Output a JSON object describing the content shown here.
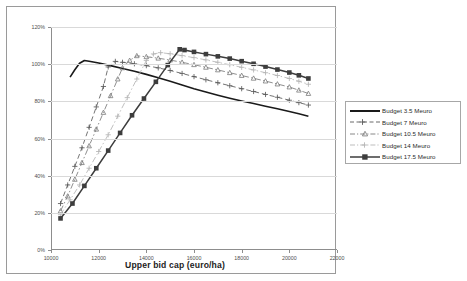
{
  "chart_data": {
    "type": "line",
    "title": "",
    "xlabel": "Upper bid cap (euro/ha)",
    "ylabel": "",
    "xlim": [
      10000,
      22000
    ],
    "ylim": [
      0,
      120
    ],
    "xticks": [
      "10000",
      "12000",
      "14000",
      "16000",
      "18000",
      "20000",
      "22000"
    ],
    "xtick_values": [
      10000,
      12000,
      14000,
      16000,
      18000,
      20000,
      22000
    ],
    "yticks": [
      "0%",
      "20%",
      "40%",
      "60%",
      "80%",
      "100%",
      "120%"
    ],
    "ytick_values": [
      0,
      20,
      40,
      60,
      80,
      100,
      120
    ],
    "grid": true,
    "legend_position": "right",
    "series": [
      {
        "name": "Budget 3.5 Meuro",
        "color": "#1a1a1a",
        "style": "solid",
        "marker": "none",
        "x": [
          10800,
          11000,
          11200,
          11400,
          11600,
          12000,
          12500,
          13000,
          13500,
          14000,
          14500,
          15000,
          15500,
          16000,
          16500,
          17000,
          17500,
          18000,
          18500,
          19000,
          19500,
          20000,
          20400,
          20800
        ],
        "y": [
          93,
          97,
          100.5,
          102,
          101.6,
          100.6,
          99.2,
          97.7,
          96.2,
          94.5,
          92.7,
          90.8,
          88.8,
          86.8,
          85.0,
          83.3,
          81.7,
          80.2,
          78.8,
          77.4,
          76.0,
          74.5,
          73.3,
          72.0
        ]
      },
      {
        "name": "Budget 7 Meuro",
        "color": "#5a5a5a",
        "style": "dashed",
        "marker": "plus",
        "x": [
          10400,
          10700,
          11000,
          11300,
          11600,
          11900,
          12200,
          12400,
          12700,
          13000,
          13500,
          14000,
          14500,
          15000,
          15500,
          16000,
          16500,
          17000,
          17500,
          18000,
          18500,
          19000,
          19500,
          20000,
          20400,
          20800
        ],
        "y": [
          25,
          35,
          45,
          55,
          66,
          77,
          88,
          98.5,
          101.5,
          101.0,
          100.2,
          99.2,
          98.0,
          96.6,
          95.0,
          93.3,
          91.6,
          90.0,
          88.4,
          86.8,
          85.3,
          83.7,
          82.2,
          80.6,
          79.3,
          78.0
        ]
      },
      {
        "name": "Budget 10.5 Meuro",
        "color": "#7a7a7a",
        "style": "dashdot",
        "marker": "triangle",
        "x": [
          10400,
          10700,
          11000,
          11300,
          11600,
          11900,
          12200,
          12500,
          12800,
          13000,
          13300,
          13600,
          14000,
          14500,
          15000,
          15500,
          16000,
          16500,
          17000,
          17500,
          18000,
          18500,
          19000,
          19500,
          20000,
          20400,
          20800
        ],
        "y": [
          21,
          29,
          38,
          47,
          56,
          65,
          74,
          83,
          92,
          98,
          102,
          104.5,
          104.0,
          103.2,
          102.2,
          101.0,
          99.7,
          98.3,
          96.9,
          95.4,
          93.9,
          92.4,
          90.9,
          89.3,
          87.7,
          86.0,
          84.2
        ]
      },
      {
        "name": "Budget 14 Meuro",
        "color": "#b5b5b5",
        "style": "dashdot",
        "marker": "plus",
        "x": [
          10400,
          10800,
          11200,
          11600,
          12000,
          12400,
          12800,
          13200,
          13600,
          14000,
          14300,
          14600,
          15000,
          15500,
          16000,
          16500,
          17000,
          17500,
          18000,
          18500,
          19000,
          19500,
          20000,
          20400,
          20800
        ],
        "y": [
          19,
          27,
          35,
          44,
          53,
          62,
          72,
          82,
          92,
          102,
          105.5,
          106.2,
          105.6,
          104.6,
          103.5,
          102.3,
          101.0,
          99.7,
          98.3,
          96.9,
          95.4,
          93.9,
          92.3,
          90.8,
          89.2
        ]
      },
      {
        "name": "Budget 17.5 Meuro",
        "color": "#3d3d3d",
        "style": "solid",
        "marker": "square",
        "x": [
          10400,
          10900,
          11400,
          11900,
          12400,
          12900,
          13400,
          13900,
          14400,
          14900,
          15400,
          15600,
          16000,
          16500,
          17000,
          17500,
          18000,
          18500,
          19000,
          19500,
          20000,
          20400,
          20800
        ],
        "y": [
          17,
          25,
          34.5,
          44,
          53.5,
          63,
          72.5,
          81.5,
          90.5,
          99.5,
          108.0,
          107.6,
          106.6,
          105.4,
          104.2,
          103.0,
          101.6,
          100.2,
          98.7,
          97.1,
          95.5,
          94.0,
          92.3
        ]
      }
    ]
  },
  "legend": {
    "entries": [
      {
        "label": "Budget 3.5 Meuro"
      },
      {
        "label": "Budget 7 Meuro"
      },
      {
        "label": "Budget 10.5 Meuro"
      },
      {
        "label": "Budget 14 Meuro"
      },
      {
        "label": "Budget 17.5 Meuro"
      }
    ]
  }
}
